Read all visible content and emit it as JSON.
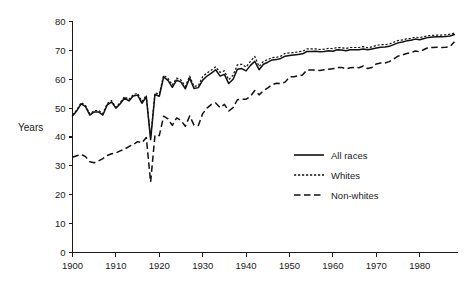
{
  "chart_data": {
    "type": "line",
    "title": "",
    "xlabel": "",
    "ylabel": "Years",
    "xlim": [
      1900,
      1989
    ],
    "ylim": [
      0,
      80
    ],
    "grid": false,
    "legend_position": "inside-right",
    "x_ticks": [
      "1900",
      "1910",
      "1920",
      "1930",
      "1940",
      "1950",
      "1960",
      "1970",
      "1980"
    ],
    "x_tick_values": [
      1900,
      1910,
      1920,
      1930,
      1940,
      1950,
      1960,
      1970,
      1980
    ],
    "y_ticks": [
      "0",
      "10",
      "20",
      "30",
      "40",
      "50",
      "60",
      "70",
      "80"
    ],
    "y_tick_values": [
      0,
      10,
      20,
      30,
      40,
      50,
      60,
      70,
      80
    ],
    "x": [
      1900,
      1901,
      1902,
      1903,
      1904,
      1905,
      1906,
      1907,
      1908,
      1909,
      1910,
      1911,
      1912,
      1913,
      1914,
      1915,
      1916,
      1917,
      1918,
      1919,
      1920,
      1921,
      1922,
      1923,
      1924,
      1925,
      1926,
      1927,
      1928,
      1929,
      1930,
      1931,
      1932,
      1933,
      1934,
      1935,
      1936,
      1937,
      1938,
      1939,
      1940,
      1941,
      1942,
      1943,
      1944,
      1945,
      1946,
      1947,
      1948,
      1949,
      1950,
      1951,
      1952,
      1953,
      1954,
      1955,
      1956,
      1957,
      1958,
      1959,
      1960,
      1961,
      1962,
      1963,
      1964,
      1965,
      1966,
      1967,
      1968,
      1969,
      1970,
      1971,
      1972,
      1973,
      1974,
      1975,
      1976,
      1977,
      1978,
      1979,
      1980,
      1981,
      1982,
      1983,
      1984,
      1985,
      1986,
      1987,
      1988
    ],
    "series": [
      {
        "name": "All races",
        "style": "solid",
        "color": "#111111",
        "values": [
          47.3,
          49.1,
          51.5,
          50.5,
          47.6,
          48.7,
          48.7,
          47.6,
          51.1,
          52.1,
          50.0,
          51.5,
          53.5,
          52.5,
          54.2,
          54.5,
          51.7,
          53.9,
          39.1,
          54.7,
          54.1,
          60.8,
          59.6,
          57.2,
          59.7,
          59.0,
          56.7,
          60.4,
          56.8,
          57.1,
          59.7,
          61.1,
          62.1,
          63.3,
          61.1,
          61.7,
          58.5,
          60.0,
          63.5,
          63.7,
          62.9,
          64.8,
          66.2,
          63.3,
          65.2,
          65.9,
          66.7,
          66.8,
          67.2,
          68.0,
          68.2,
          68.4,
          68.6,
          68.8,
          69.6,
          69.6,
          69.7,
          69.5,
          69.6,
          69.9,
          69.7,
          70.2,
          70.1,
          69.9,
          70.2,
          70.2,
          70.2,
          70.5,
          70.2,
          70.5,
          70.8,
          71.1,
          71.2,
          71.4,
          72.0,
          72.6,
          72.9,
          73.3,
          73.5,
          73.9,
          73.7,
          74.1,
          74.5,
          74.6,
          74.7,
          74.7,
          74.8,
          75.0,
          75.5
        ]
      },
      {
        "name": "Whites",
        "style": "dotted",
        "color": "#111111",
        "values": [
          47.6,
          49.4,
          51.9,
          50.9,
          48.0,
          49.1,
          49.2,
          48.1,
          51.6,
          52.6,
          50.3,
          51.9,
          54.0,
          53.0,
          54.7,
          55.1,
          52.3,
          54.4,
          39.8,
          55.3,
          54.9,
          61.4,
          60.3,
          58.0,
          60.4,
          59.7,
          57.5,
          61.1,
          57.5,
          57.8,
          60.9,
          62.2,
          63.2,
          64.3,
          62.4,
          62.9,
          59.8,
          61.4,
          65.0,
          65.2,
          64.2,
          66.2,
          67.9,
          64.4,
          66.2,
          66.8,
          67.5,
          67.6,
          68.0,
          69.0,
          69.1,
          69.2,
          69.5,
          69.7,
          70.5,
          70.5,
          70.5,
          70.3,
          70.4,
          70.7,
          70.6,
          71.0,
          70.9,
          70.7,
          71.0,
          71.0,
          71.0,
          71.3,
          70.9,
          71.2,
          71.7,
          72.0,
          72.0,
          72.2,
          72.8,
          73.4,
          73.6,
          74.0,
          74.1,
          74.6,
          74.4,
          74.8,
          75.1,
          75.2,
          75.3,
          75.3,
          75.4,
          75.6,
          76.0
        ]
      },
      {
        "name": "Non-whites",
        "style": "dashed",
        "color": "#111111",
        "values": [
          33.0,
          33.5,
          34.0,
          33.2,
          31.4,
          31.1,
          31.7,
          32.5,
          33.6,
          34.2,
          34.5,
          35.2,
          35.8,
          36.7,
          37.4,
          38.4,
          38.0,
          39.8,
          24.4,
          40.6,
          40.5,
          47.2,
          46.3,
          44.0,
          46.6,
          45.7,
          43.7,
          47.3,
          44.1,
          44.0,
          48.1,
          50.0,
          51.3,
          51.8,
          50.2,
          51.3,
          49.0,
          50.2,
          52.9,
          53.1,
          53.1,
          54.1,
          56.1,
          54.6,
          56.0,
          57.0,
          58.1,
          58.6,
          58.5,
          59.0,
          60.8,
          60.9,
          61.2,
          61.5,
          63.2,
          63.2,
          63.2,
          63.0,
          63.3,
          63.5,
          63.6,
          64.1,
          64.1,
          63.6,
          64.0,
          64.1,
          64.0,
          64.6,
          63.7,
          64.1,
          65.3,
          65.6,
          65.6,
          66.1,
          67.0,
          68.0,
          68.4,
          68.9,
          69.2,
          69.8,
          69.5,
          70.3,
          71.0,
          71.0,
          71.1,
          71.0,
          71.1,
          71.3,
          73.0
        ]
      }
    ]
  },
  "legend": {
    "items": [
      {
        "label": "All races",
        "style": "solid"
      },
      {
        "label": "Whites",
        "style": "dotted"
      },
      {
        "label": "Non-whites",
        "style": "dashed"
      }
    ]
  }
}
